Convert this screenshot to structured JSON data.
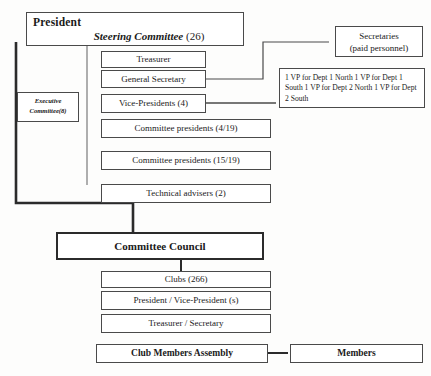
{
  "diagram": {
    "colors": {
      "line": "#4a4a4a",
      "thick_line": "#2b2b2b",
      "text": "#1a1a1a",
      "background": "#fdfdfc"
    },
    "header": {
      "president_label": "President",
      "steering_committee_label": "Steering Committee",
      "steering_committee_count": "(26)"
    },
    "executive_committee": {
      "line1": "Executive",
      "line2": "Committee(8)"
    },
    "middle_column": [
      {
        "label": "Treasurer"
      },
      {
        "label": "General Secretary"
      },
      {
        "label": "Vice-Presidents (4)"
      },
      {
        "label": "Committee presidents (4/19)"
      },
      {
        "label": "Committee presidents (15/19)"
      },
      {
        "label": "Technical advisers (2)"
      }
    ],
    "right_column": {
      "secretaries": {
        "line1": "Secretaries",
        "line2": "(paid personnel)"
      },
      "vp_departments": "1 VP for Dept 1 North 1 VP for Dept 1 South 1 VP for Dept 2 North 1 VP for Dept 2 South"
    },
    "committee_council": {
      "label": "Committee Council"
    },
    "clubs_column": [
      {
        "label": "Clubs (266)"
      },
      {
        "label": "President / Vice-President (s)"
      },
      {
        "label": "Treasurer / Secretary"
      }
    ],
    "bottom_row": {
      "assembly_label": "Club Members Assembly",
      "members_label": "Members"
    }
  }
}
